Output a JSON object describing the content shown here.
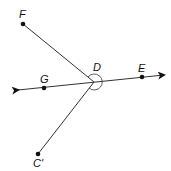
{
  "diagram": {
    "points": [
      {
        "label": "F",
        "x": 23,
        "y": 24
      },
      {
        "label": "D",
        "x": 94,
        "y": 82
      },
      {
        "label": "E",
        "x": 142,
        "y": 77
      },
      {
        "label": "G",
        "x": 44,
        "y": 88
      },
      {
        "label": "C'",
        "x": 38,
        "y": 154
      }
    ],
    "line": {
      "through": [
        "G",
        "D",
        "E"
      ],
      "arrows": "both"
    },
    "rays": [
      {
        "from": "D",
        "to": "F"
      },
      {
        "from": "D",
        "to": "C'"
      }
    ],
    "angle_mark": {
      "vertex": "D",
      "type": "arc"
    }
  }
}
